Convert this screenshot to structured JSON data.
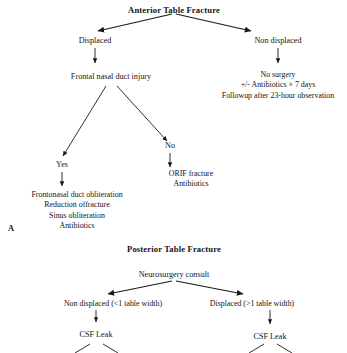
{
  "figure": {
    "panels": [
      {
        "letter": "A",
        "title": "Anterior Table Fracture",
        "nodes": {
          "root": "Anterior Table Fracture",
          "left_branch": "Displaced",
          "right_branch": "Non displaced",
          "fnd_injury": "Frontal nasal  duct  injury",
          "yes": "Yes",
          "no": "No",
          "orif_line1": "ORIF fracture",
          "orif_line2": "Antibiotics",
          "nonop_line1": "No surgery",
          "nonop_line2": "+/- Antibiotics × 7 days",
          "nonop_line3": "Followup  after 23-hour observation",
          "obliteration_line1": "Frontonasal duct obliteration",
          "obliteration_line2": "Reduction offracture",
          "obliteration_line3": "Sinus obliteration",
          "obliteration_line4": "Antibiotics"
        }
      },
      {
        "letter": "",
        "title": "Posterior Table Fracture",
        "nodes": {
          "root": "Neurosurgery consult",
          "left_branch": "Non displaced (<1 table width)",
          "right_branch": "Displaced (>1 table width)",
          "csf_left": "CSF Leak",
          "csf_right": "CSF Leak"
        }
      }
    ],
    "colors": {
      "ink": "#141414",
      "line": "#1a1a1a",
      "background": "#ffffff"
    }
  }
}
